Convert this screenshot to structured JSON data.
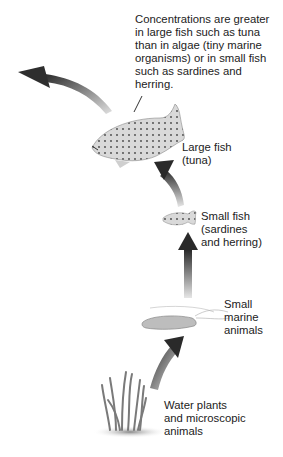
{
  "diagram": {
    "type": "food-chain-bioaccumulation",
    "annotation": "Concentrations are greater in large fish such as tuna than in algae (tiny marine organisms) or in small fish such as sardines and herring.",
    "annotation_lines": [
      "Concentrations are greater",
      "in large fish such as tuna",
      "than in algae (tiny marine",
      "organisms) or in small fish",
      "such as sardines and",
      "herring."
    ],
    "stages": [
      {
        "id": "water-plants",
        "lines": [
          "Water plants",
          "and microscopic",
          "animals"
        ]
      },
      {
        "id": "small-marine-animals",
        "lines": [
          "Small",
          "marine",
          "animals"
        ]
      },
      {
        "id": "small-fish",
        "lines": [
          "Small fish",
          "(sardines",
          "and herring)"
        ]
      },
      {
        "id": "large-fish",
        "lines": [
          "Large fish",
          "(tuna)"
        ]
      }
    ],
    "arrow_color_dark": "#2a2a2a",
    "arrow_color_light": "#d8d8d8"
  }
}
